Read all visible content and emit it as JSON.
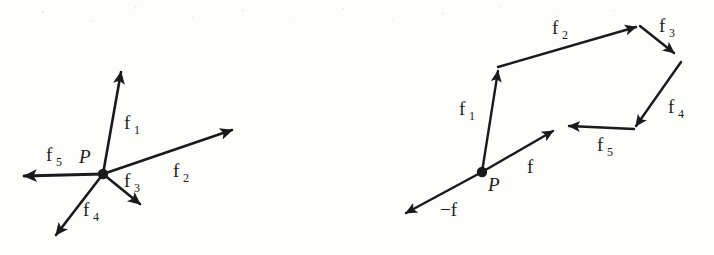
{
  "figure": {
    "background_color": "#fdfdfc",
    "ink_color": "#1a1a1a",
    "panels": [
      {
        "id": "space-diagram",
        "name": "Concurrent forces at point P",
        "point_label": "P",
        "vectors": [
          {
            "id": "f1",
            "label": "f",
            "subscript": "1"
          },
          {
            "id": "f2",
            "label": "f",
            "subscript": "2"
          },
          {
            "id": "f3",
            "label": "f",
            "subscript": "3"
          },
          {
            "id": "f4",
            "label": "f",
            "subscript": "4"
          },
          {
            "id": "f5",
            "label": "f",
            "subscript": "5"
          }
        ]
      },
      {
        "id": "force-polygon",
        "name": "Force polygon with resultant",
        "point_label": "P",
        "vectors": [
          {
            "id": "f1",
            "label": "f",
            "subscript": "1"
          },
          {
            "id": "f2",
            "label": "f",
            "subscript": "2"
          },
          {
            "id": "f3",
            "label": "f",
            "subscript": "3"
          },
          {
            "id": "f4",
            "label": "f",
            "subscript": "4"
          },
          {
            "id": "f5",
            "label": "f",
            "subscript": "5"
          },
          {
            "id": "f",
            "label": "f",
            "subscript": ""
          },
          {
            "id": "neg-f",
            "label": "−f",
            "subscript": ""
          }
        ]
      }
    ]
  },
  "labels": {
    "left": {
      "P": "P",
      "f1": "f",
      "f1_sub": "1",
      "f2": "f",
      "f2_sub": "2",
      "f3": "f",
      "f3_sub": "3",
      "f4": "f",
      "f4_sub": "4",
      "f5": "f",
      "f5_sub": "5"
    },
    "right": {
      "P": "P",
      "f1": "f",
      "f1_sub": "1",
      "f2": "f",
      "f2_sub": "2",
      "f3": "f",
      "f3_sub": "3",
      "f4": "f",
      "f4_sub": "4",
      "f5": "f",
      "f5_sub": "5",
      "f": "f",
      "negf": "−f"
    }
  }
}
